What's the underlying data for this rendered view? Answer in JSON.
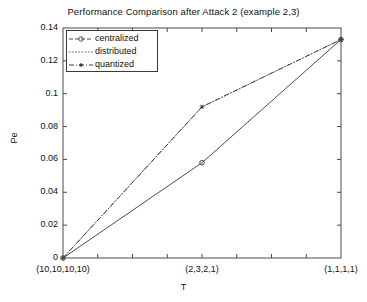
{
  "chart_data": {
    "type": "line",
    "title": "Performance Comparison after Attack 2 (example 2,3)",
    "xlabel": "T",
    "ylabel": "Pe",
    "categories": [
      "(10,10,10,10)",
      "(2,3,2,1)",
      "(1,1,1,1)"
    ],
    "x": [
      0,
      1,
      2
    ],
    "ylim": [
      0,
      0.14
    ],
    "xlim": [
      0,
      2
    ],
    "yticks": [
      0,
      0.02,
      0.04,
      0.06,
      0.08,
      0.1,
      0.12,
      0.14
    ],
    "ytick_labels": [
      "0",
      "0.02",
      "0.04",
      "0.06",
      "0.08",
      "0.1",
      "0.12",
      "0.14"
    ],
    "grid": false,
    "legend_position": "upper-left",
    "series": [
      {
        "name": "centralized",
        "values": [
          0,
          0.058,
          0.133
        ],
        "linestyle": "solid",
        "marker": "circle",
        "color": "#4d4d4d"
      },
      {
        "name": "distributed",
        "values": [
          0,
          0.092,
          0.133
        ],
        "linestyle": "dotted",
        "marker": "none",
        "color": "#6a6a6a"
      },
      {
        "name": "quantized",
        "values": [
          0,
          0.092,
          0.133
        ],
        "linestyle": "dashdot",
        "marker": "star",
        "color": "#3a3a3a"
      }
    ]
  },
  "legend": {
    "items": [
      {
        "label": "centralized"
      },
      {
        "label": "distributed"
      },
      {
        "label": "quantized"
      }
    ]
  },
  "axes": {
    "frame_color": "#4a4a4a",
    "background": "#ffffff"
  }
}
